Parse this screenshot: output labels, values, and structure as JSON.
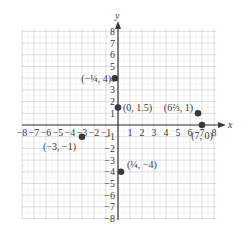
{
  "chart_data": {
    "type": "scatter",
    "title": "",
    "xlabel": "x",
    "ylabel": "y",
    "xlim": [
      -8,
      8
    ],
    "ylim": [
      -8,
      8
    ],
    "grid": true,
    "x_ticks": [
      "-8",
      "-7",
      "-6",
      "-5",
      "-4",
      "-3",
      "-2",
      "-1",
      "1",
      "2",
      "3",
      "4",
      "5",
      "6",
      "7",
      "8"
    ],
    "y_ticks": [
      "8",
      "7",
      "6",
      "5",
      "4",
      "3",
      "2",
      "1",
      "-1",
      "-2",
      "-3",
      "-4",
      "-5",
      "-6",
      "-7",
      "-8"
    ],
    "points": [
      {
        "x": -0.25,
        "y": 4,
        "label": "(−¼, 4)"
      },
      {
        "x": 0,
        "y": 1.5,
        "label": "(0, 1.5)"
      },
      {
        "x": 6.667,
        "y": 1,
        "label": "(6⅔, 1)"
      },
      {
        "x": 7,
        "y": 0,
        "label": "(7, 0)"
      },
      {
        "x": -3,
        "y": -1,
        "label": "(−3, −1)"
      },
      {
        "x": 0.25,
        "y": -4,
        "label": "(¼, −4)"
      }
    ],
    "colors": {
      "point": "#3a3a3a",
      "axis": "#3a3a3a",
      "grid": "#c8c8c8",
      "text": "#3a3a3a"
    }
  }
}
